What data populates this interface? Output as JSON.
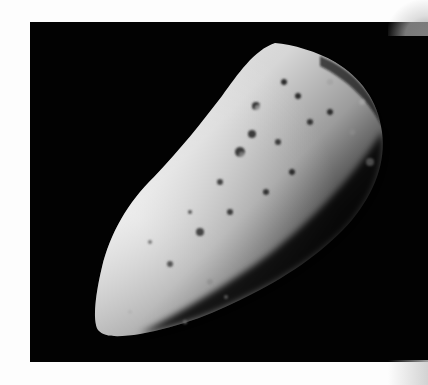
{
  "image": {
    "subject": "asteroid",
    "description": "Elongated cratered asteroid photographed against a black sky",
    "colors": {
      "page_background": "#fdfdfd",
      "sky": "#020202",
      "lit_surface": "#e8e8e8",
      "mid_surface": "#9a9a9a",
      "shadow_surface": "#1a1a1a"
    }
  }
}
